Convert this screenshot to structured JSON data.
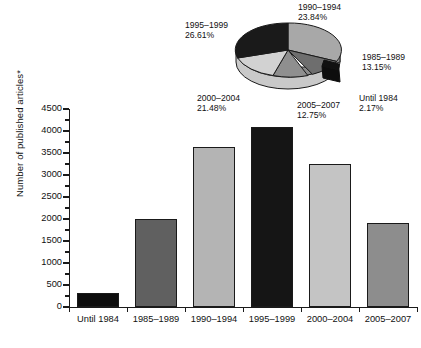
{
  "chart_data": [
    {
      "type": "bar",
      "title": "",
      "xlabel": "",
      "ylabel": "Number of published articles*",
      "ylim": [
        0,
        4500
      ],
      "ytick_values": [
        0,
        500,
        1000,
        1500,
        2000,
        2500,
        3000,
        3500,
        4000,
        4500
      ],
      "ytick_labels": [
        "0",
        "500",
        "1000",
        "1500",
        "2000",
        "2500",
        "3000",
        "3500",
        "4000",
        "4500"
      ],
      "grid": false,
      "legend": "none",
      "categories": [
        "Until 1984",
        "1985–1989",
        "1990–1994",
        "1995–1999",
        "2000–2004",
        "2005–2007"
      ],
      "values": [
        320,
        2000,
        3630,
        4100,
        3250,
        1900
      ],
      "bar_colors": [
        "#0d0d0d",
        "#606060",
        "#b4b4b4",
        "#151515",
        "#c4c4c4",
        "#8d8d8d"
      ]
    },
    {
      "type": "pie",
      "title": "",
      "legend": "labels-around-slices",
      "categories": [
        "1990–1994",
        "1985–1989",
        "Until 1984",
        "2005–2007",
        "2000–2004",
        "1995–1999"
      ],
      "values": [
        23.84,
        13.15,
        2.17,
        12.75,
        21.48,
        26.61
      ],
      "value_labels": [
        "23.84%",
        "13.15%",
        "2.17%",
        "12.75%",
        "21.48%",
        "26.61%"
      ],
      "slice_colors": [
        "#a8a8a8",
        "#6e6e6e",
        "#0d0d0d",
        "#8f8f8f",
        "#d2d2d2",
        "#1a1a1a"
      ],
      "exploded": [
        "Until 1984"
      ],
      "labels": [
        {
          "name": "1990–1994",
          "pct": "23.84%"
        },
        {
          "name": "1985–1989",
          "pct": "13.15%"
        },
        {
          "name": "Until 1984",
          "pct": "2.17%"
        },
        {
          "name": "2005–2007",
          "pct": "12.75%"
        },
        {
          "name": "2000–2004",
          "pct": "21.48%"
        },
        {
          "name": "1995–1999",
          "pct": "26.61%"
        }
      ]
    }
  ],
  "axis": {
    "y_title": "Number of published articles*",
    "y_ticks": [
      "4500",
      "4000",
      "3500",
      "3000",
      "2500",
      "2000",
      "1500",
      "1000",
      "500",
      "0"
    ],
    "x_categories": [
      "Until 1984",
      "1985–1989",
      "1990–1994",
      "1995–1999",
      "2000–2004",
      "2005–2007"
    ]
  },
  "pie": {
    "l_1990": {
      "name": "1990–1994",
      "pct": "23.84%"
    },
    "l_1995": {
      "name": "1995–1999",
      "pct": "26.61%"
    },
    "l_1985": {
      "name": "1985–1989",
      "pct": "13.15%"
    },
    "l_until": {
      "name": "Until 1984",
      "pct": "2.17%"
    },
    "l_2000": {
      "name": "2000–2004",
      "pct": "21.48%"
    },
    "l_2005": {
      "name": "2005–2007",
      "pct": "12.75%"
    }
  }
}
